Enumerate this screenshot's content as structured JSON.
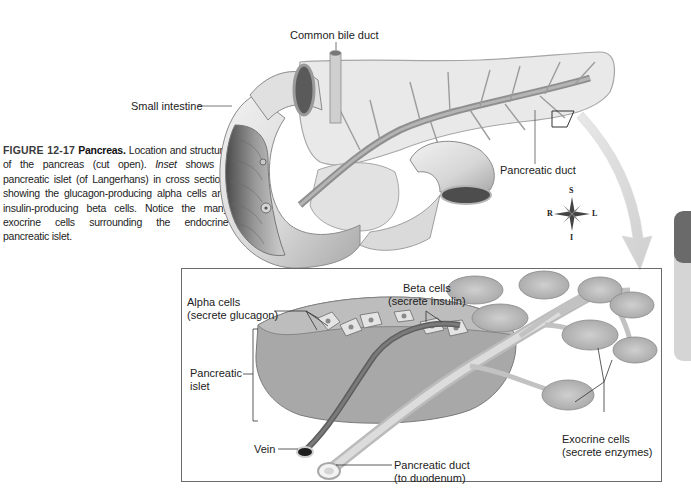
{
  "caption": {
    "figure_number": "FIGURE 12-17",
    "figure_title": "Pancreas.",
    "text_part1": "Location and structure of the pancreas (cut open).",
    "inset_word": "Inset",
    "text_part2": "shows a pancreatic islet (of Langerhans) in cross section, showing the glucagon-producing alpha cells and insulin-producing beta cells. Notice the many exocrine cells surrounding the endocrine pancreatic islet."
  },
  "main_illustration": {
    "labels": {
      "common_bile_duct": "Common bile duct",
      "small_intestine": "Small intestine",
      "pancreatic_duct": "Pancreatic duct"
    },
    "compass": {
      "superior": "S",
      "inferior": "I",
      "right": "R",
      "left": "L"
    }
  },
  "inset": {
    "labels": {
      "alpha_cells_line1": "Alpha cells",
      "alpha_cells_line2": "(secrete glucagon)",
      "beta_cells_line1": "Beta cells",
      "beta_cells_line2": "(secrete insulin)",
      "pancreatic_islet_line1": "Pancreatic",
      "pancreatic_islet_line2": "islet",
      "vein": "Vein",
      "pancreatic_duct_line1": "Pancreatic duct",
      "pancreatic_duct_line2": "(to duodenum)",
      "exocrine_line1": "Exocrine cells",
      "exocrine_line2": "(secrete enzymes)"
    }
  },
  "colors": {
    "tissue_light": "#e6e6e6",
    "tissue_mid": "#bdbdbd",
    "tissue_dark": "#8a8a8a",
    "duct": "#9a9a9a",
    "tab_dark": "#6a6a6a",
    "tab_light": "#d5d5d5"
  }
}
